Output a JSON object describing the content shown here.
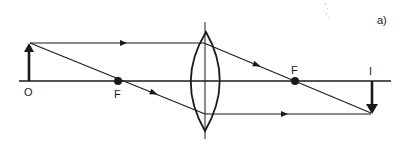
{
  "diagram": {
    "type": "thin-lens-ray-diagram",
    "panel_label": "a)",
    "colors": {
      "line": "#1a1a1a",
      "background": "#ffffff"
    },
    "labels": {
      "object": "O",
      "focus_left": "F",
      "focus_right": "F",
      "image": "I"
    },
    "geometry": {
      "axis_y": 81,
      "axis_x_start": 19,
      "axis_x_end": 391,
      "lens_x": 205,
      "lens_top": 32,
      "lens_bottom": 131,
      "object_x": 29,
      "object_top": 43,
      "focus_left_x": 118,
      "focus_right_x": 295,
      "image_x": 372,
      "image_bottom": 113
    }
  }
}
